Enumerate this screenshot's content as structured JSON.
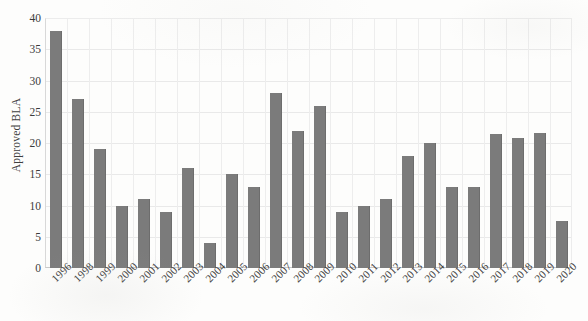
{
  "chart_data": {
    "type": "bar",
    "title": "",
    "subtitle": "",
    "xlabel": "",
    "ylabel": "Approved BLA",
    "ylim": [
      0,
      40
    ],
    "ytick_labels": [
      "0",
      "5",
      "10",
      "15",
      "20",
      "25",
      "30",
      "35",
      "40"
    ],
    "ytick_values": [
      0,
      5,
      10,
      15,
      20,
      25,
      30,
      35,
      40
    ],
    "grid": "both",
    "legend": "none",
    "bar_color": "#7b7b7b",
    "gridline_color": "#e9e9e9",
    "axis_color": "#c9c9c9",
    "background_color": "#fdfdfc",
    "categories": [
      "1996",
      "1998",
      "1999",
      "2000",
      "2001",
      "2002",
      "2003",
      "2004",
      "2005",
      "2006",
      "2007",
      "2008",
      "2009",
      "2010",
      "2011",
      "2012",
      "2013",
      "2014",
      "2015",
      "2016",
      "2017",
      "2018",
      "2019",
      "2020"
    ],
    "values": [
      38,
      27,
      19,
      10,
      11,
      9,
      16,
      4,
      15,
      13,
      28,
      22,
      26,
      9,
      10,
      11,
      18,
      20,
      13,
      13,
      21.5,
      20.8,
      21.6,
      7.6
    ]
  }
}
